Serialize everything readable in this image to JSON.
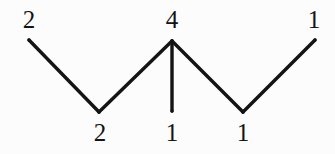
{
  "figure": {
    "background_color": "#fcfcfc",
    "stroke_color": "#141414",
    "stroke_width": 3.4,
    "label_color": "#141414",
    "label_font_size": 25,
    "width": 335,
    "height": 154
  },
  "chart_data": {
    "type": "diagram",
    "subtype": "labeled-tree-zigzag",
    "title": "",
    "xlabel": "",
    "ylabel": "",
    "nodes": [
      {
        "id": "n1",
        "label": "2",
        "x": 29,
        "y": 40,
        "role": "leaf",
        "label_position": "above",
        "label_x": 29,
        "label_y": 7
      },
      {
        "id": "n2",
        "label": "2",
        "x": 99,
        "y": 112,
        "role": "valley",
        "label_position": "below",
        "label_x": 100,
        "label_y": 120
      },
      {
        "id": "n3",
        "label": "4",
        "x": 172,
        "y": 41,
        "role": "apex",
        "label_position": "above",
        "label_x": 172,
        "label_y": 7
      },
      {
        "id": "n4",
        "label": "1",
        "x": 172,
        "y": 111,
        "role": "pendant",
        "label_position": "below",
        "label_x": 172,
        "label_y": 120
      },
      {
        "id": "n5",
        "label": "1",
        "x": 243,
        "y": 112,
        "role": "valley",
        "label_position": "below",
        "label_x": 243,
        "label_y": 120
      },
      {
        "id": "n6",
        "label": "1",
        "x": 315,
        "y": 40,
        "role": "leaf",
        "label_position": "above",
        "label_x": 314,
        "label_y": 7
      }
    ],
    "edges": [
      {
        "from": "n1",
        "to": "n2"
      },
      {
        "from": "n2",
        "to": "n3"
      },
      {
        "from": "n3",
        "to": "n4"
      },
      {
        "from": "n3",
        "to": "n5"
      },
      {
        "from": "n5",
        "to": "n6"
      }
    ],
    "labels": [
      "2",
      "2",
      "4",
      "1",
      "1",
      "1"
    ],
    "values": [
      2,
      2,
      4,
      1,
      1,
      1
    ],
    "grid": false,
    "legend": null,
    "axes": false
  }
}
